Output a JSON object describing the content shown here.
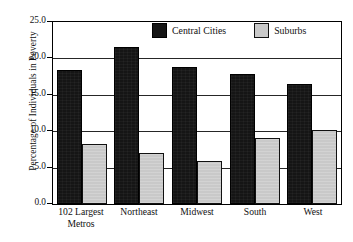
{
  "chart_data": {
    "type": "bar",
    "title": "",
    "xlabel": "",
    "ylabel": "Percentage of Individuals in Poverty",
    "ylim": [
      0.0,
      25.0
    ],
    "ytick_labels": [
      "0.0",
      "5.0",
      "10.0",
      "15.0",
      "20.0",
      "25.0"
    ],
    "ytick_values": [
      0.0,
      5.0,
      10.0,
      15.0,
      20.0,
      25.0
    ],
    "grid": "horizontal",
    "legend_position": "top-center-inside",
    "categories": [
      "102 Largest Metros",
      "Northeast",
      "Midwest",
      "South",
      "West"
    ],
    "category_lines": [
      [
        "102 Largest",
        "Metros"
      ],
      [
        "Northeast",
        ""
      ],
      [
        "Midwest",
        ""
      ],
      [
        "South",
        ""
      ],
      [
        "West",
        ""
      ]
    ],
    "series": [
      {
        "name": "Central Cities",
        "color": "#151515",
        "values": [
          18.4,
          21.5,
          18.8,
          17.8,
          16.5
        ]
      },
      {
        "name": "Suburbs",
        "color": "#c9c9c9",
        "values": [
          8.2,
          7.0,
          5.9,
          9.0,
          10.2
        ]
      }
    ]
  },
  "legend": {
    "items": [
      {
        "label": "Central Cities"
      },
      {
        "label": "Suburbs"
      }
    ]
  }
}
